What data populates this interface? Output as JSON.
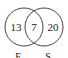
{
  "diagram": {
    "type": "venn",
    "sets": [
      {
        "label": "F",
        "only": "13"
      },
      {
        "label": "S",
        "only": "20"
      }
    ],
    "intersection": "7"
  }
}
